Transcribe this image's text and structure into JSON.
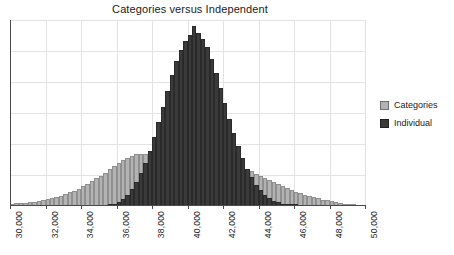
{
  "chart_data": {
    "type": "bar",
    "title": "Categories versus Independent",
    "xlabel": "",
    "ylabel": "",
    "xlim": [
      30000,
      50000
    ],
    "ylim": [
      0,
      1
    ],
    "grid": true,
    "legend_position": "right",
    "bin_width": 250,
    "tick_labels": [
      "30,000",
      "32,000",
      "34,000",
      "36,000",
      "38,000",
      "40,000",
      "42,000",
      "44,000",
      "46,000",
      "48,000",
      "50,000"
    ],
    "tick_values": [
      30000,
      32000,
      34000,
      36000,
      38000,
      40000,
      42000,
      44000,
      46000,
      48000,
      50000
    ],
    "legend": [
      "Categories",
      "Individual"
    ],
    "colors": {
      "categories": "#b3b3b3",
      "categories_edge": "#8f8f8f",
      "individual": "#3a3a3a",
      "individual_edge": "#2a2a2a",
      "grid": "#e3e3e3",
      "axis": "#4a4a4a",
      "text": "#1a1a1a"
    },
    "x": [
      30125,
      30375,
      30625,
      30875,
      31125,
      31375,
      31625,
      31875,
      32125,
      32375,
      32625,
      32875,
      33125,
      33375,
      33625,
      33875,
      34125,
      34375,
      34625,
      34875,
      35125,
      35375,
      35625,
      35875,
      36125,
      36375,
      36625,
      36875,
      37125,
      37375,
      37625,
      37875,
      38125,
      38375,
      38625,
      38875,
      39125,
      39375,
      39625,
      39875,
      40125,
      40375,
      40625,
      40875,
      41125,
      41375,
      41625,
      41875,
      42125,
      42375,
      42625,
      42875,
      43125,
      43375,
      43625,
      43875,
      44125,
      44375,
      44625,
      44875,
      45125,
      45375,
      45625,
      45875,
      46125,
      46375,
      46625,
      46875,
      47125,
      47375,
      47625,
      47875,
      48125,
      48375,
      48625,
      48875,
      49125,
      49375
    ],
    "series": [
      {
        "name": "Categories",
        "values": [
          0.012,
          0.014,
          0.016,
          0.018,
          0.021,
          0.024,
          0.028,
          0.032,
          0.037,
          0.043,
          0.049,
          0.056,
          0.064,
          0.073,
          0.083,
          0.094,
          0.106,
          0.119,
          0.133,
          0.148,
          0.164,
          0.18,
          0.197,
          0.214,
          0.231,
          0.246,
          0.259,
          0.27,
          0.277,
          0.281,
          0.282,
          0.279,
          0.273,
          0.265,
          0.255,
          0.245,
          0.236,
          0.229,
          0.224,
          0.221,
          0.22,
          0.221,
          0.224,
          0.228,
          0.232,
          0.236,
          0.238,
          0.239,
          0.237,
          0.233,
          0.227,
          0.219,
          0.209,
          0.198,
          0.186,
          0.174,
          0.162,
          0.15,
          0.138,
          0.127,
          0.116,
          0.105,
          0.095,
          0.086,
          0.077,
          0.069,
          0.061,
          0.054,
          0.047,
          0.041,
          0.035,
          0.03,
          0.025,
          0.021,
          0.017,
          0.013,
          0.009,
          0.005
        ]
      },
      {
        "name": "Individual",
        "values": [
          0,
          0,
          0,
          0,
          0,
          0,
          0,
          0,
          0,
          0,
          0,
          0,
          0,
          0,
          0,
          0,
          0,
          0,
          0,
          0,
          0,
          0,
          0.006,
          0.012,
          0.022,
          0.038,
          0.06,
          0.09,
          0.128,
          0.175,
          0.232,
          0.297,
          0.37,
          0.45,
          0.535,
          0.62,
          0.702,
          0.777,
          0.84,
          0.888,
          0.92,
          0.97,
          0.93,
          0.9,
          0.855,
          0.79,
          0.715,
          0.636,
          0.552,
          0.47,
          0.392,
          0.32,
          0.256,
          0.2,
          0.154,
          0.115,
          0.085,
          0.061,
          0.043,
          0.029,
          0.019,
          0.012,
          0.007,
          0.004,
          0.002,
          0,
          0,
          0,
          0,
          0,
          0,
          0,
          0,
          0,
          0,
          0,
          0,
          0
        ]
      }
    ],
    "horizontal_gridlines": [
      0.1667,
      0.3333,
      0.5,
      0.6667,
      0.8333,
      1.0
    ]
  }
}
